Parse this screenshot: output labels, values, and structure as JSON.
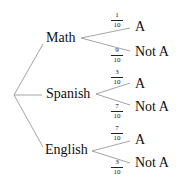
{
  "tree": {
    "branches": [
      {
        "label": "Math",
        "outcomes": [
          {
            "label": "A",
            "num": "1",
            "den": "10"
          },
          {
            "label": "Not A",
            "num": "9",
            "den": "10"
          }
        ]
      },
      {
        "label": "Spanish",
        "outcomes": [
          {
            "label": "A",
            "num": "3",
            "den": "10"
          },
          {
            "label": "Not A",
            "num": "7",
            "den": "10"
          }
        ]
      },
      {
        "label": "English",
        "outcomes": [
          {
            "label": "A",
            "num": "7",
            "den": "10"
          },
          {
            "label": "Not A",
            "num": "3",
            "den": "10"
          }
        ]
      }
    ]
  }
}
